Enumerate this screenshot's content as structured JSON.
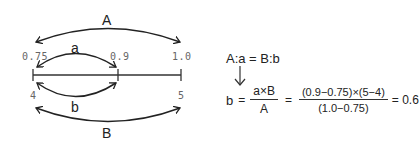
{
  "diagram": {
    "number_line": {
      "ticks": [
        {
          "position": "left",
          "top_value": "0.75",
          "bottom_value": "4"
        },
        {
          "position": "middle",
          "top_value": "0.9",
          "bottom_value": ""
        },
        {
          "position": "right",
          "top_value": "1.0",
          "bottom_value": "5"
        }
      ]
    },
    "arcs": {
      "A": {
        "label": "A",
        "from": "0.75",
        "to": "1.0",
        "side": "top"
      },
      "a": {
        "label": "a",
        "from": "0.75",
        "to": "0.9",
        "side": "top"
      },
      "b": {
        "label": "b",
        "from": "4",
        "to": "unknown",
        "side": "bottom"
      },
      "B": {
        "label": "B",
        "from": "4",
        "to": "5",
        "side": "bottom"
      }
    },
    "colors": {
      "line": "#222222",
      "tick_label": "#666666"
    }
  },
  "formula": {
    "proportion": "A:a = B:b",
    "arrow": "↓",
    "lhs": "b",
    "eq1": "=",
    "frac1": {
      "numerator": "a×B",
      "denominator": "A"
    },
    "eq2": "=",
    "frac2": {
      "numerator": "(0.9−0.75)×(5−4)",
      "denominator": "(1.0−0.75)"
    },
    "result": "= 0.6"
  }
}
